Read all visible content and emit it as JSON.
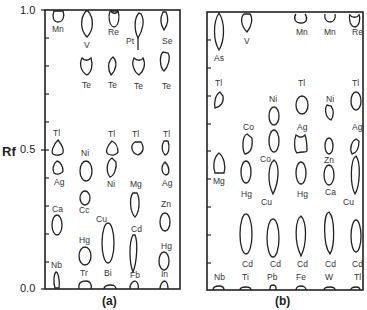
{
  "axis": {
    "label": "Rf",
    "ticks": [
      "1.0",
      "0.5",
      "0.0"
    ]
  },
  "panels": [
    {
      "caption": "(a)",
      "columns": [
        {
          "spots": [
            {
              "label": "Mn",
              "rf": 0.97
            },
            {
              "label": "Tl",
              "rf": 0.5
            },
            {
              "label": "Ag",
              "rf": 0.41
            },
            {
              "label": "Ca",
              "rf": 0.22
            },
            {
              "label": "Nb",
              "rf": 0.04
            }
          ]
        },
        {
          "spots": [
            {
              "label": "V",
              "rf": 0.91
            },
            {
              "label": "Te",
              "rf": 0.78
            },
            {
              "label": "Ni",
              "rf": 0.39
            },
            {
              "label": "Cc",
              "rf": 0.3
            },
            {
              "label": "Hg",
              "rf": 0.13
            },
            {
              "label": "Tr",
              "rf": 0.02
            }
          ]
        },
        {
          "spots": [
            {
              "label": "Re",
              "rf": 0.97
            },
            {
              "label": "Te",
              "rf": 0.78
            },
            {
              "label": "Tl",
              "rf": 0.49
            },
            {
              "label": "Ni",
              "rf": 0.4
            },
            {
              "label": "Cu",
              "rf": 0.18
            },
            {
              "label": "Bi",
              "rf": 0.0
            }
          ]
        },
        {
          "spots": [
            {
              "label": "Pt",
              "rf": 0.92
            },
            {
              "label": "Te",
              "rf": 0.78
            },
            {
              "label": "Tl",
              "rf": 0.52
            },
            {
              "label": "Mg",
              "rf": 0.3
            },
            {
              "label": "Cd",
              "rf": 0.14
            },
            {
              "label": "Fb",
              "rf": 0.02
            }
          ]
        },
        {
          "spots": [
            {
              "label": "Se",
              "rf": 0.93
            },
            {
              "label": "Te",
              "rf": 0.8
            },
            {
              "label": "Tl",
              "rf": 0.49
            },
            {
              "label": "Ag",
              "rf": 0.41
            },
            {
              "label": "Zn",
              "rf": 0.24
            },
            {
              "label": "Hg",
              "rf": 0.09
            },
            {
              "label": "In",
              "rf": 0.02
            }
          ]
        }
      ]
    },
    {
      "caption": "(b)",
      "columns": [
        {
          "spots": [
            {
              "label": "As",
              "rf": 0.93
            },
            {
              "label": "Tl",
              "rf": 0.7
            },
            {
              "label": "Mg",
              "rf": 0.45
            },
            {
              "label": "Nb",
              "rf": 0.01
            }
          ]
        },
        {
          "spots": [
            {
              "label": "V",
              "rf": 0.97
            },
            {
              "label": "Co",
              "rf": 0.51
            },
            {
              "label": "Hg",
              "rf": 0.38
            },
            {
              "label": "Cd",
              "rf": 0.21
            },
            {
              "label": "Ti",
              "rf": 0.01
            }
          ]
        },
        {
          "spots": [
            {
              "label": "Ni",
              "rf": 0.61
            },
            {
              "label": "Co",
              "rf": 0.52
            },
            {
              "label": "Cu",
              "rf": 0.35
            },
            {
              "label": "Cd",
              "rf": 0.21
            },
            {
              "label": "Pb",
              "rf": 0.02
            }
          ]
        },
        {
          "spots": [
            {
              "label": "Mn",
              "rf": 0.98
            },
            {
              "label": "Tl",
              "rf": 0.67
            },
            {
              "label": "Ag",
              "rf": 0.51
            },
            {
              "label": "Hg",
              "rf": 0.36
            },
            {
              "label": "Cd",
              "rf": 0.2
            },
            {
              "label": "Fe",
              "rf": 0.01
            }
          ]
        },
        {
          "spots": [
            {
              "label": "Mn",
              "rf": 0.98
            },
            {
              "label": "Ni",
              "rf": 0.62
            },
            {
              "label": "Zn",
              "rf": 0.5
            },
            {
              "label": "Ca",
              "rf": 0.38
            },
            {
              "label": "Cd",
              "rf": 0.2
            },
            {
              "label": "W",
              "rf": 0.01
            }
          ]
        },
        {
          "spots": [
            {
              "label": "Re",
              "rf": 0.97
            },
            {
              "label": "Tl",
              "rf": 0.67
            },
            {
              "label": "Ag",
              "rf": 0.51
            },
            {
              "label": "Cu",
              "rf": 0.36
            },
            {
              "label": "Cd",
              "rf": 0.21
            },
            {
              "label": "Tl",
              "rf": 0.01
            }
          ]
        }
      ]
    }
  ],
  "labels": {
    "a": [
      "Mn",
      "V",
      "Re",
      "Pt",
      "Se",
      "Te",
      "Te",
      "Te",
      "Te",
      "Tl",
      "Tl",
      "Tl",
      "Tl",
      "Ni",
      "Ag",
      "Ni",
      "Mg",
      "Ag",
      "Ca",
      "Cc",
      "Zn",
      "Cu",
      "Cd",
      "Hg",
      "Hg",
      "Nb",
      "Tr",
      "Bi",
      "Fb",
      "In"
    ],
    "b": [
      "V",
      "Mn",
      "Mn",
      "Mn",
      "Re",
      "As",
      "Tl",
      "Ni",
      "Tl",
      "Ni",
      "Tl",
      "Co",
      "Ag",
      "Ag",
      "Co",
      "Zn",
      "Mg",
      "Hg",
      "Cu",
      "Hg",
      "Ca",
      "Cu",
      "Cd",
      "Cd",
      "Cd",
      "Cd",
      "Cd",
      "Nb",
      "Ti",
      "Pb",
      "Fe",
      "W",
      "Tl"
    ]
  }
}
